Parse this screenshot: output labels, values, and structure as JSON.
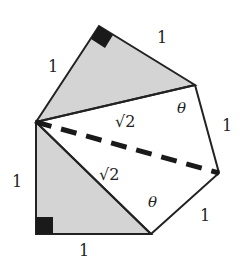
{
  "diagram": {
    "title": "",
    "colors": {
      "shade": "#d4d4d4",
      "stroke": "#222222",
      "marker": "#1a1a1a"
    },
    "labels": {
      "top_left_side": "1",
      "top_right_side": "1",
      "right_upper_side": "1",
      "right_lower_side": "1",
      "left_side": "1",
      "bottom_side": "1",
      "upper_diagonal": "√2",
      "lower_diagonal": "√2",
      "angle_upper": "θ",
      "angle_lower": "θ"
    }
  }
}
